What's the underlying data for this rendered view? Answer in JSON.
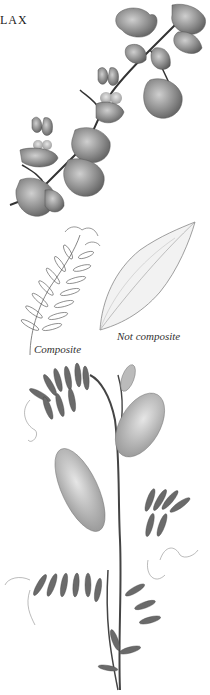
{
  "page": {
    "heading_fragment": "LAX"
  },
  "illustrations": [
    {
      "name": "ivy-leaved-toadflax",
      "subject": "trailing vine with rounded lobed leaves and two-lipped flowers"
    },
    {
      "name": "composite-leaf",
      "caption": "Composite"
    },
    {
      "name": "simple-leaf",
      "caption": "Not composite"
    },
    {
      "name": "vetch",
      "subject": "vetch plant with pinnate leaves, tendrils and flower spikes"
    }
  ],
  "captions": {
    "composite": "Composite",
    "not_composite": "Not composite"
  },
  "colors": {
    "background": "#ffffff",
    "ink": "#222222",
    "leaf_shade": "#7a7a7a",
    "leaf_dark": "#4a4a4a",
    "flower_light": "#bdbdbd"
  }
}
